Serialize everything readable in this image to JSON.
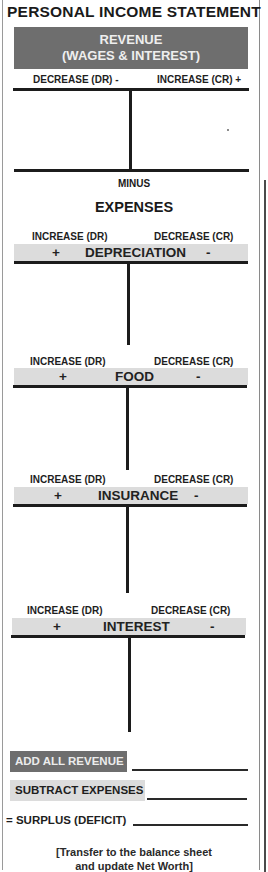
{
  "title": "PERSONAL INCOME STATEMENT",
  "revenue": {
    "header_line1": "REVENUE",
    "header_line2": "(WAGES & INTEREST)",
    "left_label": "DECREASE (DR) -",
    "right_label": "INCREASE (CR) +"
  },
  "minus_label": "MINUS",
  "expenses_label": "EXPENSES",
  "expense_accounts": [
    {
      "name": "DEPRECIATION",
      "left_label": "INCREASE (DR)",
      "right_label": "DECREASE (CR)",
      "left_sign": "+",
      "right_sign": "-"
    },
    {
      "name": "FOOD",
      "left_label": "INCREASE (DR)",
      "right_label": "DECREASE (CR)",
      "left_sign": "+",
      "right_sign": "-"
    },
    {
      "name": "INSURANCE",
      "left_label": "INCREASE (DR)",
      "right_label": "DECREASE (CR)",
      "left_sign": "+",
      "right_sign": "-"
    },
    {
      "name": "INTEREST",
      "left_label": "INCREASE (DR)",
      "right_label": "DECREASE (CR)",
      "left_sign": "+",
      "right_sign": "-"
    }
  ],
  "summary": {
    "add_revenue": "ADD ALL REVENUE",
    "subtract_expenses": "SUBTRACT EXPENSES",
    "surplus": "= SURPLUS (DEFICIT)"
  },
  "note_line1": "[Transfer to the balance sheet",
  "note_line2": "and update Net Worth]",
  "colors": {
    "dark_box": "#6e6e6e",
    "light_bar": "#dcdcdc",
    "line": "#1c1c1c"
  }
}
